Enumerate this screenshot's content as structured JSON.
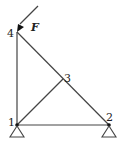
{
  "diagram": {
    "type": "truss",
    "nodes": [
      {
        "id": "1",
        "label": "1",
        "x": 17,
        "y": 125
      },
      {
        "id": "2",
        "label": "2",
        "x": 109,
        "y": 125
      },
      {
        "id": "3",
        "label": "3",
        "x": 63,
        "y": 79
      },
      {
        "id": "4",
        "label": "4",
        "x": 17,
        "y": 32
      }
    ],
    "members": [
      {
        "from": "1",
        "to": "4"
      },
      {
        "from": "1",
        "to": "2"
      },
      {
        "from": "1",
        "to": "3"
      },
      {
        "from": "4",
        "to": "3"
      },
      {
        "from": "3",
        "to": "2"
      }
    ],
    "supports": [
      {
        "node": "1",
        "type": "pin"
      },
      {
        "node": "2",
        "type": "pin"
      }
    ],
    "load": {
      "label": "F",
      "node": "4",
      "direction": "down-left at 45°"
    },
    "colors": {
      "line": "#333333",
      "fill": "#ffffff"
    }
  }
}
